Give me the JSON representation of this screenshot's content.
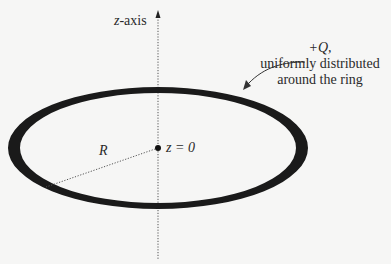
{
  "diagram": {
    "type": "ring-of-charge",
    "axis": {
      "label_var": "z",
      "label_rest": "-axis"
    },
    "charge": {
      "line1": "+Q,",
      "line2": "uniformly distributed",
      "line3": "around the ring"
    },
    "radius_label": "R",
    "origin_label": "z = 0",
    "colors": {
      "background": "#f6f6f5",
      "ring": "#1a1a1a",
      "text": "#2a2a2a",
      "dotted": "#555555"
    }
  }
}
